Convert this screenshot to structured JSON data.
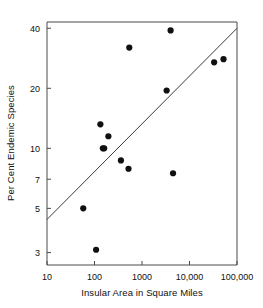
{
  "chart_data": {
    "type": "scatter",
    "title": "",
    "xlabel": "Insular Area in Square Miles",
    "ylabel": "Per Cent Endemic Species",
    "xscale": "log",
    "yscale": "log",
    "xlim": [
      10,
      100000
    ],
    "ylim": [
      2.6,
      43
    ],
    "grid": false,
    "legend": null,
    "xticks": [
      10,
      100,
      1000,
      10000,
      100000
    ],
    "xticklabels": [
      "10",
      "100",
      "1000",
      "10,000",
      "100,000"
    ],
    "yticks": [
      3,
      5,
      7,
      10,
      20,
      40
    ],
    "yticklabels": [
      "3",
      "5",
      "7",
      "10",
      "20",
      "40"
    ],
    "points": [
      {
        "x": 58,
        "y": 5.0
      },
      {
        "x": 108,
        "y": 3.1
      },
      {
        "x": 133,
        "y": 13.2
      },
      {
        "x": 150,
        "y": 10.0
      },
      {
        "x": 160,
        "y": 10.0
      },
      {
        "x": 196,
        "y": 11.5
      },
      {
        "x": 360,
        "y": 8.7
      },
      {
        "x": 520,
        "y": 7.9
      },
      {
        "x": 540,
        "y": 32.0
      },
      {
        "x": 3300,
        "y": 19.5
      },
      {
        "x": 4500,
        "y": 7.5
      },
      {
        "x": 4000,
        "y": 39.0
      },
      {
        "x": 33000,
        "y": 27.0
      },
      {
        "x": 52000,
        "y": 28.0
      }
    ],
    "fit_line": {
      "label": "regression line",
      "x_start": 10,
      "y_start": 4.4,
      "x_end": 100000,
      "y_end": 40.0
    }
  },
  "axis": {
    "x_title": "Insular Area in Square Miles",
    "y_title": "Per Cent Endemic Species"
  }
}
